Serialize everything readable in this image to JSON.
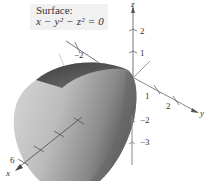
{
  "caption": {
    "title": "Surface:",
    "equation": "x − y² − z² = 0"
  },
  "axes": {
    "x": {
      "label": "x",
      "ticks": [
        "6"
      ]
    },
    "y": {
      "label": "y",
      "ticks": [
        "−2",
        "1",
        "2"
      ]
    },
    "z": {
      "label": "z",
      "ticks": [
        "2",
        "1",
        "−2",
        "−3"
      ]
    }
  },
  "surface": {
    "type": "elliptic paraboloid",
    "opens_along": "x",
    "shading_colors": [
      "#3f3f3f",
      "#7d7d7d",
      "#bdbdbd",
      "#e4e4e4"
    ]
  }
}
